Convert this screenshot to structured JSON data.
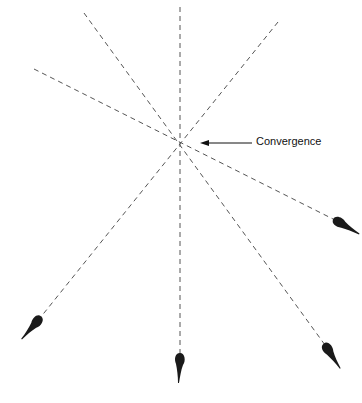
{
  "diagram": {
    "label": "Convergence",
    "center": [
      180,
      143
    ],
    "colors": {
      "line": "#555555",
      "blob": "#1a1a1a",
      "text": "#111111"
    },
    "rays": [
      {
        "name": "ray-vertical",
        "from": [
          180,
          7
        ],
        "to": [
          180,
          355
        ]
      },
      {
        "name": "ray-nw-se",
        "from": [
          84,
          13
        ],
        "to": [
          325,
          345
        ]
      },
      {
        "name": "ray-ne-sw",
        "from": [
          278,
          22
        ],
        "to": [
          40,
          318
        ]
      },
      {
        "name": "ray-w-e",
        "from": [
          34,
          69
        ],
        "to": [
          335,
          220
        ]
      }
    ],
    "blobs": [
      {
        "name": "blob-bottom-left",
        "x": 40,
        "y": 318,
        "angle": 128
      },
      {
        "name": "blob-bottom-center",
        "x": 180,
        "y": 355,
        "angle": 90
      },
      {
        "name": "blob-bottom-right",
        "x": 325,
        "y": 345,
        "angle": 54
      },
      {
        "name": "blob-right",
        "x": 335,
        "y": 220,
        "angle": 27
      }
    ]
  }
}
